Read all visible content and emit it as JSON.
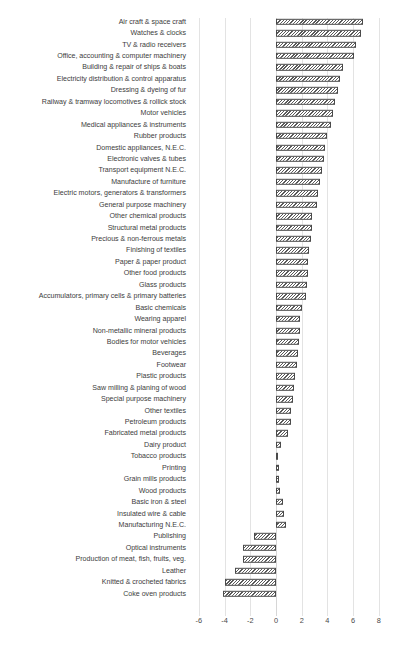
{
  "chart_data": {
    "type": "bar",
    "orientation": "horizontal",
    "title": "",
    "subtitle": "",
    "xlabel": "",
    "ylabel": "",
    "xlim": [
      -7,
      9
    ],
    "xticks": [
      -6,
      -4,
      -2,
      0,
      2,
      4,
      6,
      8
    ],
    "xtick_labels": [
      "-6",
      "-4",
      "-2",
      "0",
      "2",
      "4",
      "6",
      "8"
    ],
    "grid": true,
    "grid_axis": "x",
    "legend": null,
    "bar_style": "diagonal-hatch",
    "categories": [
      "Air craft & space craft",
      "Watches & clocks",
      "TV & radio receivers",
      "Office, accounting & computer machinery",
      "Building & repair of ships & boats",
      "Electricity distribution & control apparatus",
      "Dressing & dyeing of fur",
      "Railway & tramway locomotives & rollick stock",
      "Motor vehicles",
      "Medical appliances & instruments",
      "Rubber products",
      "Domestic appliances, N.E.C.",
      "Electronic valves & tubes",
      "Transport equipment N.E.C.",
      "Manufacture of furniture",
      "Electric motors, generators & transformers",
      "General purpose machinery",
      "Other chemical products",
      "Structural metal products",
      "Precious & non-ferrous metals",
      "Finishing of textiles",
      "Paper & paper product",
      "Other food products",
      "Glass products",
      "Accumulators, primary cells & primary batteries",
      "Basic chemicals",
      "Wearing apparel",
      "Non-metallic mineral products",
      "Bodies for motor vehicles",
      "Beverages",
      "Footwear",
      "Plastic products",
      "Saw milling & planing of wood",
      "Special purpose machinery",
      "Other textiles",
      "Petroleum products",
      "Fabricated metal products",
      "Dairy product",
      "Tobacco products",
      "Printing",
      "Grain mills products",
      "Wood products",
      "Basic iron & steel",
      "Insulated wire & cable",
      "Manufacturing N.E.C.",
      "Publishing",
      "Optical instruments",
      "Production of meat, fish, fruits, veg.",
      "Leather",
      "Knitted & crocheted fabrics",
      "Coke oven products"
    ],
    "values": [
      6.8,
      6.6,
      6.2,
      6.1,
      5.2,
      5.0,
      4.8,
      4.6,
      4.4,
      4.3,
      4.0,
      3.8,
      3.7,
      3.6,
      3.4,
      3.3,
      3.2,
      2.8,
      2.8,
      2.7,
      2.6,
      2.5,
      2.5,
      2.4,
      2.3,
      2.0,
      1.9,
      1.9,
      1.8,
      1.7,
      1.6,
      1.5,
      1.4,
      1.3,
      1.2,
      1.2,
      0.9,
      0.4,
      0.15,
      0.2,
      0.25,
      0.35,
      0.55,
      0.6,
      0.75,
      -1.7,
      -2.6,
      -2.6,
      -3.2,
      -4.0,
      -4.1
    ]
  },
  "footer": {
    "note": ""
  }
}
